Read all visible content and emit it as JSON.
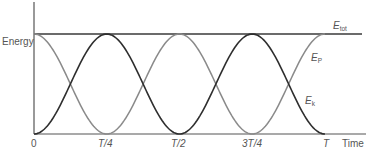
{
  "chart_data": {
    "type": "line",
    "title": "",
    "xlabel": "Time",
    "ylabel": "Energy",
    "x_ticks": [
      "0",
      "T/4",
      "T/2",
      "3T/4",
      "T"
    ],
    "x_range": [
      0,
      1
    ],
    "y_range": [
      0,
      1
    ],
    "grid": false,
    "legend": "inline labels at right",
    "series": [
      {
        "name": "E_tot",
        "label_main": "E",
        "label_sub": "tot",
        "description": "Total energy, constant",
        "formula": "E_tot = 1",
        "x": [
          0,
          0.25,
          0.5,
          0.75,
          1.0
        ],
        "values": [
          1,
          1,
          1,
          1,
          1
        ],
        "color": "#3a3a3a"
      },
      {
        "name": "E_p",
        "label_main": "E",
        "label_sub": "P",
        "description": "Potential energy, cos^2(2*pi*t/T)",
        "formula": "E_p = cos^2(2*pi*t/T)",
        "x": [
          0,
          0.125,
          0.25,
          0.375,
          0.5,
          0.625,
          0.75,
          0.875,
          1.0
        ],
        "values": [
          1,
          0.5,
          0,
          0.5,
          1,
          0.5,
          0,
          0.5,
          1
        ],
        "color": "#8a8a8a"
      },
      {
        "name": "E_k",
        "label_main": "E",
        "label_sub": "k",
        "description": "Kinetic energy, sin^2(2*pi*t/T)",
        "formula": "E_k = sin^2(2*pi*t/T)",
        "x": [
          0,
          0.125,
          0.25,
          0.375,
          0.5,
          0.625,
          0.75,
          0.875,
          1.0
        ],
        "values": [
          0,
          0.5,
          1,
          0.5,
          0,
          0.5,
          1,
          0.5,
          0
        ],
        "color": "#2e2e2e"
      }
    ]
  },
  "labels": {
    "y_axis": "Energy",
    "x_axis": "Time",
    "ticks": [
      "0",
      "T/4",
      "T/2",
      "3T/4",
      "T"
    ],
    "e_tot": {
      "main": "E",
      "sub": "tot"
    },
    "e_p": {
      "main": "E",
      "sub": "P"
    },
    "e_k": {
      "main": "E",
      "sub": "k"
    }
  },
  "colors": {
    "axis": "#555555",
    "total": "#3a3a3a",
    "potential": "#8a8a8a",
    "kinetic": "#2e2e2e",
    "text": "#555555"
  }
}
